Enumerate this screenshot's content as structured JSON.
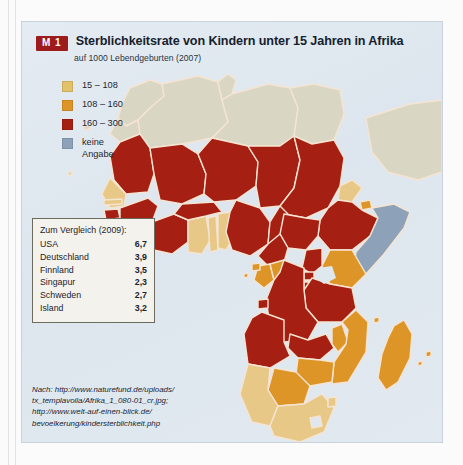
{
  "figure": {
    "badge": "M 1",
    "title": "Sterblichkeitsrate von Kindern unter 15 Jahren in Afrika",
    "subtitle": "auf 1000  Lebendgeburten (2007)"
  },
  "legend": {
    "items": [
      {
        "label": "15  –  108",
        "color": "#e3c06a",
        "name": "legend-class-low"
      },
      {
        "label": "108 – 160",
        "color": "#dd9528",
        "name": "legend-class-mid"
      },
      {
        "label": "160 – 300",
        "color": "#a51f12",
        "name": "legend-class-high"
      },
      {
        "label": "keine\nAngabe",
        "color": "#8da2b8",
        "name": "legend-class-nodata"
      }
    ]
  },
  "comparison": {
    "heading": "Zum Vergleich (2009):",
    "rows": [
      {
        "country": "USA",
        "value": "6,7"
      },
      {
        "country": "Deutschland",
        "value": "3,9"
      },
      {
        "country": "Finnland",
        "value": "3,5"
      },
      {
        "country": "Singapur",
        "value": "2,3"
      },
      {
        "country": "Schweden",
        "value": "2,7"
      },
      {
        "country": "Island",
        "value": "3,2"
      }
    ]
  },
  "source": {
    "line1": "Nach: http://www.naturefund.de/uploads/",
    "line2": "tx_templavoila/Afrika_1_080-01_cr.jpg;",
    "line3": "http://www.welt-auf-einen-blick.de/",
    "line4": "bevoelkerung/kindersterblichkeit.php"
  },
  "map": {
    "sea_color": "#dfe7ef",
    "border_color": "#f6e4d2",
    "classes": {
      "low": "#e7c887",
      "mid": "#dd9528",
      "high": "#a51f12",
      "nodata_grey": "#d9d7c4",
      "nodata_blue": "#8da2b8"
    }
  }
}
